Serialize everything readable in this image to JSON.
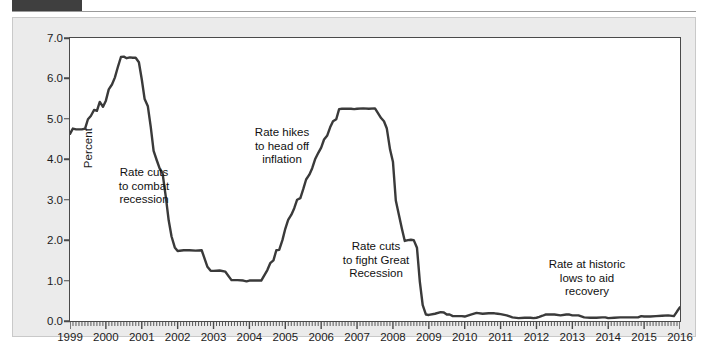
{
  "figure": {
    "background_color": "#ebebeb",
    "plot_background_color": "#ffffff",
    "line_color": "#3a3a3a",
    "axis_color": "#4a4a4a"
  },
  "chart_data": {
    "type": "line",
    "title": "",
    "xlabel": "",
    "ylabel": "Percent",
    "xlim": [
      1999,
      2016
    ],
    "ylim": [
      0.0,
      7.0
    ],
    "grid": false,
    "legend": null,
    "y_ticks": [
      "0.0",
      "1.0",
      "2.0",
      "3.0",
      "4.0",
      "5.0",
      "6.0",
      "7.0"
    ],
    "y_tick_values": [
      0.0,
      1.0,
      2.0,
      3.0,
      4.0,
      5.0,
      6.0,
      7.0
    ],
    "x_ticks": [
      "1999",
      "2000",
      "2001",
      "2002",
      "2003",
      "2004",
      "2005",
      "2006",
      "2007",
      "2008",
      "2009",
      "2010",
      "2011",
      "2012",
      "2013",
      "2014",
      "2015",
      "2016"
    ],
    "x_tick_values": [
      1999,
      2000,
      2001,
      2002,
      2003,
      2004,
      2005,
      2006,
      2007,
      2008,
      2009,
      2010,
      2011,
      2012,
      2013,
      2014,
      2015,
      2016
    ],
    "x_minor_tick_count": 204,
    "series": [
      {
        "name": "Federal funds rate",
        "x": [
          1999.0,
          1999.08,
          1999.17,
          1999.25,
          1999.33,
          1999.42,
          1999.5,
          1999.58,
          1999.67,
          1999.75,
          1999.83,
          1999.92,
          2000.0,
          2000.08,
          2000.17,
          2000.25,
          2000.33,
          2000.42,
          2000.5,
          2000.58,
          2000.67,
          2000.75,
          2000.83,
          2000.92,
          2001.0,
          2001.08,
          2001.17,
          2001.25,
          2001.33,
          2001.42,
          2001.5,
          2001.58,
          2001.67,
          2001.75,
          2001.83,
          2001.92,
          2002.0,
          2002.17,
          2002.33,
          2002.5,
          2002.67,
          2002.83,
          2002.92,
          2003.0,
          2003.17,
          2003.33,
          2003.5,
          2003.67,
          2003.83,
          2003.92,
          2004.0,
          2004.17,
          2004.33,
          2004.5,
          2004.58,
          2004.67,
          2004.75,
          2004.83,
          2004.92,
          2005.0,
          2005.08,
          2005.17,
          2005.25,
          2005.33,
          2005.42,
          2005.5,
          2005.58,
          2005.67,
          2005.75,
          2005.83,
          2005.92,
          2006.0,
          2006.08,
          2006.17,
          2006.25,
          2006.33,
          2006.42,
          2006.5,
          2006.58,
          2006.67,
          2006.75,
          2006.83,
          2006.92,
          2007.0,
          2007.17,
          2007.33,
          2007.5,
          2007.67,
          2007.75,
          2007.83,
          2007.92,
          2008.0,
          2008.08,
          2008.17,
          2008.25,
          2008.33,
          2008.42,
          2008.5,
          2008.58,
          2008.67,
          2008.75,
          2008.83,
          2008.92,
          2009.0,
          2009.17,
          2009.33,
          2009.42,
          2009.5,
          2009.58,
          2009.67,
          2009.83,
          2009.92,
          2010.0,
          2010.17,
          2010.33,
          2010.5,
          2010.67,
          2010.83,
          2010.92,
          2011.0,
          2011.17,
          2011.33,
          2011.5,
          2011.67,
          2011.83,
          2011.92,
          2012.0,
          2012.08,
          2012.17,
          2012.25,
          2012.33,
          2012.5,
          2012.67,
          2012.83,
          2012.92,
          2013.0,
          2013.17,
          2013.33,
          2013.5,
          2013.67,
          2013.83,
          2013.92,
          2014.0,
          2014.17,
          2014.33,
          2014.5,
          2014.67,
          2014.83,
          2014.92,
          2015.0,
          2015.17,
          2015.33,
          2015.5,
          2015.67,
          2015.83,
          2015.92,
          2016.0
        ],
        "y": [
          4.63,
          4.76,
          4.74,
          4.74,
          4.74,
          4.76,
          4.99,
          5.07,
          5.22,
          5.2,
          5.42,
          5.3,
          5.45,
          5.73,
          5.85,
          6.02,
          6.27,
          6.53,
          6.54,
          6.5,
          6.52,
          6.51,
          6.51,
          6.4,
          5.98,
          5.49,
          5.31,
          4.8,
          4.21,
          3.97,
          3.77,
          3.65,
          3.07,
          2.49,
          2.09,
          1.82,
          1.73,
          1.75,
          1.75,
          1.74,
          1.75,
          1.34,
          1.24,
          1.24,
          1.25,
          1.22,
          1.01,
          1.01,
          1.0,
          0.98,
          1.0,
          1.0,
          1.0,
          1.26,
          1.43,
          1.5,
          1.75,
          1.76,
          2.0,
          2.28,
          2.5,
          2.63,
          2.79,
          3.0,
          3.04,
          3.26,
          3.5,
          3.62,
          3.78,
          4.0,
          4.16,
          4.29,
          4.49,
          4.59,
          4.79,
          4.94,
          4.99,
          5.24,
          5.25,
          5.25,
          5.25,
          5.25,
          5.24,
          5.25,
          5.26,
          5.25,
          5.26,
          5.02,
          4.94,
          4.76,
          4.24,
          3.94,
          2.98,
          2.61,
          2.28,
          1.98,
          2.0,
          2.01,
          2.0,
          1.81,
          0.97,
          0.39,
          0.16,
          0.15,
          0.18,
          0.22,
          0.21,
          0.16,
          0.16,
          0.12,
          0.12,
          0.12,
          0.11,
          0.16,
          0.2,
          0.18,
          0.19,
          0.19,
          0.18,
          0.17,
          0.14,
          0.09,
          0.07,
          0.08,
          0.08,
          0.07,
          0.08,
          0.1,
          0.13,
          0.16,
          0.16,
          0.16,
          0.14,
          0.16,
          0.16,
          0.14,
          0.14,
          0.09,
          0.08,
          0.08,
          0.09,
          0.09,
          0.07,
          0.08,
          0.09,
          0.09,
          0.09,
          0.09,
          0.12,
          0.11,
          0.11,
          0.12,
          0.13,
          0.14,
          0.12,
          0.24,
          0.34
        ]
      }
    ],
    "annotations": [
      {
        "text": "Rate cuts\nto combat\nrecession",
        "x_px": 88,
        "y_px": 148,
        "width_px": 86
      },
      {
        "text": "Rate hikes\nto head off\ninflation",
        "x_px": 226,
        "y_px": 108,
        "width_px": 86
      },
      {
        "text": "Rate cuts\nto fight Great\nRecession",
        "x_px": 315,
        "y_px": 222,
        "width_px": 96
      },
      {
        "text": "Rate at historic\nlows to aid\nrecovery",
        "x_px": 521,
        "y_px": 240,
        "width_px": 106
      }
    ]
  }
}
